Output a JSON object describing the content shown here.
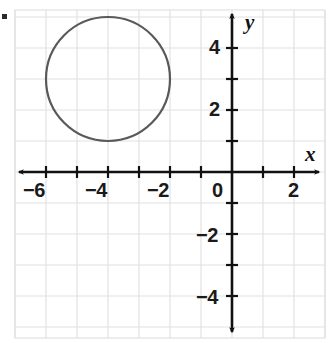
{
  "figure": {
    "kind": "coordinate-plane-graph",
    "background_color": "#ffffff",
    "grid_color": "#e2e2e2",
    "axis_color": "#111111",
    "curve_color": "#595959",
    "label_color": "#1a1a1a"
  },
  "axes": {
    "x_axis_label": "x",
    "y_axis_label": "y",
    "origin_label": "0",
    "x_tick_labels": [
      "−6",
      "−4",
      "−2",
      "2"
    ],
    "y_tick_labels": [
      "4",
      "2",
      "−2",
      "−4"
    ]
  },
  "chart_data": {
    "type": "scatter",
    "title": "",
    "xlabel": "x",
    "ylabel": "y",
    "grid": true,
    "legend": "none",
    "xlim": [
      -7,
      3
    ],
    "ylim": [
      -5.2,
      5.2
    ],
    "xticks": [
      -6,
      -4,
      -2,
      0,
      2
    ],
    "yticks": [
      4,
      2,
      0,
      -2,
      -4
    ],
    "xtick_labels": [
      "−6",
      "−4",
      "−2",
      "0",
      "2"
    ],
    "ytick_labels": [
      "4",
      "2",
      "0",
      "−2",
      "−4"
    ],
    "x_tick_step": 1,
    "y_tick_step": 1,
    "x_label_step": 2,
    "y_label_step": 2,
    "series": [
      {
        "name": "circle",
        "type": "circle",
        "center": [
          -4,
          3
        ],
        "radius": 2,
        "equation": "(x + 4)^2 + (y - 3)^2 = 4",
        "stroke": "#595959",
        "stroke_width": 2.2,
        "fill": "none",
        "extent_x": [
          -6,
          -2
        ],
        "extent_y": [
          1,
          5
        ]
      }
    ],
    "annotations": []
  },
  "geometry": {
    "origin_px": [
      232,
      172
    ],
    "unit_px": 31,
    "plot_left_px": 15,
    "plot_top_px": 10,
    "plot_right_px": 325,
    "plot_bottom_px": 338
  }
}
